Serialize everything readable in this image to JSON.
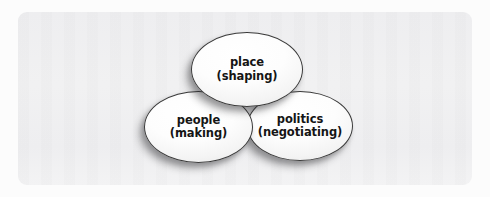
{
  "figure": {
    "type": "venn-diagram",
    "background_color": "#fcfcfc",
    "panel_color": "#f0f0f1",
    "outline_color": "#3a3a3a",
    "label_color": "#151515"
  },
  "panel": {
    "ghost_text": {
      "top": "",
      "middle_left": "",
      "middle_right": "",
      "bottom": ""
    }
  },
  "nodes": [
    {
      "id": "place",
      "title": "place",
      "subtitle": "(shaping)",
      "position": "top"
    },
    {
      "id": "people",
      "title": "people",
      "subtitle": "(making)",
      "position": "bottom-left"
    },
    {
      "id": "politics",
      "title": "politics",
      "subtitle": "(negotiating)",
      "position": "bottom-right"
    }
  ]
}
